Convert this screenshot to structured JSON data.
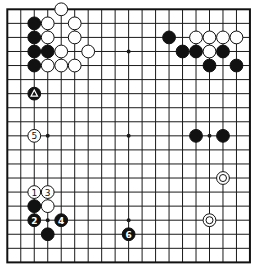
{
  "board": {
    "size": 19,
    "origin_x": 7.3,
    "origin_y": 9.3,
    "spacing_x": 13.48,
    "spacing_y": 14.06,
    "stone_radius": 6.4,
    "line_color": "#1a1a1a",
    "black_color": "#111111",
    "white_color": "#ffffff"
  },
  "star_points": [
    [
      3,
      3
    ],
    [
      9,
      3
    ],
    [
      15,
      3
    ],
    [
      3,
      9
    ],
    [
      9,
      9
    ],
    [
      15,
      9
    ],
    [
      3,
      15
    ],
    [
      9,
      15
    ],
    [
      15,
      15
    ]
  ],
  "stones": [
    {
      "color": "white",
      "col": 4,
      "row": 0
    },
    {
      "color": "black",
      "col": 2,
      "row": 1
    },
    {
      "color": "white",
      "col": 3,
      "row": 1
    },
    {
      "color": "white",
      "col": 5,
      "row": 1
    },
    {
      "color": "black",
      "col": 2,
      "row": 2
    },
    {
      "color": "white",
      "col": 3,
      "row": 2
    },
    {
      "color": "white",
      "col": 5,
      "row": 2
    },
    {
      "color": "black",
      "col": 2,
      "row": 3
    },
    {
      "color": "black",
      "col": 3,
      "row": 3
    },
    {
      "color": "white",
      "col": 4,
      "row": 3
    },
    {
      "color": "white",
      "col": 6,
      "row": 3
    },
    {
      "color": "black",
      "col": 2,
      "row": 4
    },
    {
      "color": "white",
      "col": 3,
      "row": 4
    },
    {
      "color": "white",
      "col": 4,
      "row": 4
    },
    {
      "color": "white",
      "col": 5,
      "row": 4
    },
    {
      "color": "black",
      "col": 2,
      "row": 6,
      "marker": "triangle"
    },
    {
      "color": "black",
      "col": 12,
      "row": 2
    },
    {
      "color": "white",
      "col": 14,
      "row": 2
    },
    {
      "color": "white",
      "col": 15,
      "row": 2
    },
    {
      "color": "white",
      "col": 16,
      "row": 2
    },
    {
      "color": "white",
      "col": 17,
      "row": 2
    },
    {
      "color": "black",
      "col": 13,
      "row": 3
    },
    {
      "color": "black",
      "col": 14,
      "row": 3
    },
    {
      "color": "white",
      "col": 15,
      "row": 3
    },
    {
      "color": "black",
      "col": 16,
      "row": 3
    },
    {
      "color": "black",
      "col": 15,
      "row": 4
    },
    {
      "color": "black",
      "col": 17,
      "row": 4
    },
    {
      "color": "white",
      "col": 2,
      "row": 9,
      "label": "5"
    },
    {
      "color": "black",
      "col": 14,
      "row": 9
    },
    {
      "color": "black",
      "col": 16,
      "row": 9
    },
    {
      "color": "white",
      "col": 16,
      "row": 12,
      "marker": "circle"
    },
    {
      "color": "white",
      "col": 15,
      "row": 15,
      "marker": "circle"
    },
    {
      "color": "white",
      "col": 2,
      "row": 13,
      "label": "1"
    },
    {
      "color": "white",
      "col": 3,
      "row": 13,
      "label": "3"
    },
    {
      "color": "black",
      "col": 2,
      "row": 14
    },
    {
      "color": "white",
      "col": 3,
      "row": 14
    },
    {
      "color": "black",
      "col": 2,
      "row": 15,
      "label": "2"
    },
    {
      "color": "black",
      "col": 4,
      "row": 15,
      "label": "4"
    },
    {
      "color": "black",
      "col": 3,
      "row": 16
    },
    {
      "color": "black",
      "col": 9,
      "row": 16,
      "label": "6"
    }
  ],
  "move_labels": [
    "1",
    "2",
    "3",
    "4",
    "5",
    "6"
  ]
}
